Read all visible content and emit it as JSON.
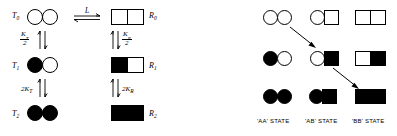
{
  "figure": {
    "left_panel": {
      "name": "concerted-mwc-scheme",
      "rows": [
        {
          "t_label": "T",
          "t_sub": "0",
          "r_label": "R",
          "r_sub": "0",
          "t_shape": "two-open-circles",
          "r_shape": "two-open-squares"
        },
        {
          "t_label": "T",
          "t_sub": "1",
          "r_label": "R",
          "r_sub": "1",
          "t_shape": "filled-circle-open-circle",
          "r_shape": "filled-square-open-square"
        },
        {
          "t_label": "T",
          "t_sub": "2",
          "r_label": "R",
          "r_sub": "2",
          "t_shape": "two-filled-circles",
          "r_shape": "two-filled-squares"
        }
      ],
      "horizontal_equilibrium": {
        "label": "L"
      },
      "vertical_constants": [
        {
          "name": "K_T_over_2",
          "numerator": "K",
          "numerator_sub": "T",
          "denominator": "2",
          "side": "left"
        },
        {
          "name": "K_R_over_2",
          "numerator": "K",
          "numerator_sub": "R",
          "denominator": "2",
          "side": "right"
        },
        {
          "name": "2K_T",
          "text": "2K",
          "text_sub": "T",
          "side": "left"
        },
        {
          "name": "2K_R",
          "text": "2K",
          "text_sub": "R",
          "side": "right"
        }
      ]
    },
    "right_panel": {
      "name": "sequential-knf-grid",
      "column_labels": [
        "'AA' STATE",
        "'AB' STATE",
        "'BB' STATE"
      ],
      "grid": [
        [
          "two-open-circles",
          "open-circle-open-square",
          "two-open-squares"
        ],
        [
          "filled-circle-open-circle",
          "open-circle-filled-square",
          "open-square-filled-square"
        ],
        [
          "two-filled-circles",
          "filled-circle-filled-square",
          "two-filled-squares"
        ]
      ],
      "arrows": [
        {
          "name": "arrow-aa0-to-ab1",
          "from": "row0-col0",
          "to": "row1-col1"
        },
        {
          "name": "arrow-ab1-to-bb2",
          "from": "row1-col1",
          "to": "row2-col2"
        }
      ]
    },
    "colors": {
      "ink": "#000000",
      "paper": "#ffffff"
    }
  }
}
